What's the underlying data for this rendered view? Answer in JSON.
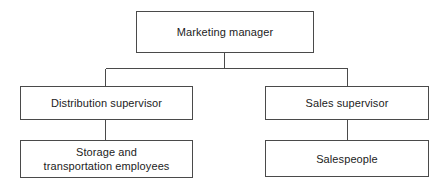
{
  "diagram": {
    "type": "organizational-chart",
    "background_color": "#ffffff",
    "line_color": "#4a4a4a",
    "text_color": "#1c1c1c",
    "nodes": [
      {
        "id": "root",
        "label": "Marketing manager",
        "level": 1
      },
      {
        "id": "distribution-supervisor",
        "label": "Distribution supervisor",
        "level": 2
      },
      {
        "id": "sales-supervisor",
        "label": "Sales supervisor",
        "level": 2
      },
      {
        "id": "storage-transportation",
        "label": "Storage and\ntransportation employees",
        "level": 3
      },
      {
        "id": "salespeople",
        "label": "Salespeople",
        "level": 3
      }
    ],
    "edges": [
      {
        "from": "root",
        "to": "distribution-supervisor"
      },
      {
        "from": "root",
        "to": "sales-supervisor"
      },
      {
        "from": "distribution-supervisor",
        "to": "storage-transportation"
      },
      {
        "from": "sales-supervisor",
        "to": "salespeople"
      }
    ]
  }
}
